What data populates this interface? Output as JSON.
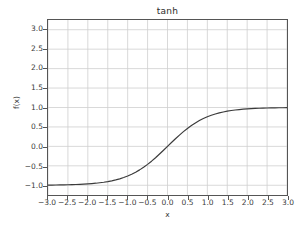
{
  "chart_data": {
    "type": "line",
    "title": "tanh",
    "xlabel": "x",
    "ylabel": "f(x)",
    "xlim": [
      -3.0,
      3.0
    ],
    "ylim": [
      -1.25,
      3.25
    ],
    "grid": true,
    "legend": null,
    "line_color": "#3b3b3b",
    "grid_color": "#cfcfcf",
    "axis_color": "#555555",
    "background_color": "#ffffff",
    "xticks": [
      "−3.0",
      "−2.5",
      "−2.0",
      "−1.5",
      "−1.0",
      "−0.5",
      "0.0",
      "0.5",
      "1.0",
      "1.5",
      "2.0",
      "2.5",
      "3.0"
    ],
    "xtick_values": [
      -3.0,
      -2.5,
      -2.0,
      -1.5,
      -1.0,
      -0.5,
      0.0,
      0.5,
      1.0,
      1.5,
      2.0,
      2.5,
      3.0
    ],
    "yticks": [
      "3.0",
      "2.5",
      "2.0",
      "1.5",
      "1.0",
      "0.5",
      "0.0",
      "−0.5",
      "−1.0"
    ],
    "ytick_values": [
      3.0,
      2.5,
      2.0,
      1.5,
      1.0,
      0.5,
      0.0,
      -0.5,
      -1.0
    ],
    "series": [
      {
        "name": "tanh",
        "x": [
          -3.0,
          -2.9,
          -2.8,
          -2.7,
          -2.6,
          -2.5,
          -2.4,
          -2.3,
          -2.2,
          -2.1,
          -2.0,
          -1.9,
          -1.8,
          -1.7,
          -1.6,
          -1.5,
          -1.4,
          -1.3,
          -1.2,
          -1.1,
          -1.0,
          -0.9,
          -0.8,
          -0.7,
          -0.6,
          -0.5,
          -0.4,
          -0.3,
          -0.2,
          -0.1,
          0.0,
          0.1,
          0.2,
          0.3,
          0.4,
          0.5,
          0.6,
          0.7,
          0.8,
          0.9,
          1.0,
          1.1,
          1.2,
          1.3,
          1.4,
          1.5,
          1.6,
          1.7,
          1.8,
          1.9,
          2.0,
          2.1,
          2.2,
          2.3,
          2.4,
          2.5,
          2.6,
          2.7,
          2.8,
          2.9,
          3.0
        ],
        "y": [
          -0.995,
          -0.994,
          -0.993,
          -0.991,
          -0.989,
          -0.987,
          -0.984,
          -0.98,
          -0.976,
          -0.97,
          -0.964,
          -0.956,
          -0.947,
          -0.935,
          -0.922,
          -0.905,
          -0.885,
          -0.862,
          -0.834,
          -0.8,
          -0.762,
          -0.716,
          -0.664,
          -0.604,
          -0.537,
          -0.462,
          -0.38,
          -0.291,
          -0.197,
          -0.1,
          0.0,
          0.1,
          0.197,
          0.291,
          0.38,
          0.462,
          0.537,
          0.604,
          0.664,
          0.716,
          0.762,
          0.8,
          0.834,
          0.862,
          0.885,
          0.905,
          0.922,
          0.935,
          0.947,
          0.956,
          0.964,
          0.97,
          0.976,
          0.98,
          0.984,
          0.987,
          0.989,
          0.991,
          0.993,
          0.994,
          0.995
        ]
      }
    ]
  }
}
